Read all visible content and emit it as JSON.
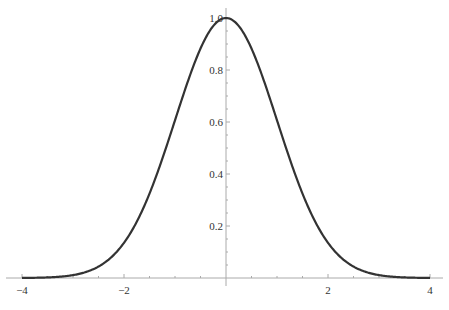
{
  "chart_data": {
    "type": "line",
    "title": "",
    "xlabel": "",
    "ylabel": "",
    "xlim": [
      -4,
      4
    ],
    "ylim": [
      0,
      1.0
    ],
    "grid": false,
    "legend": null,
    "x_ticks": [
      "-4",
      "-2",
      "2",
      "4"
    ],
    "y_ticks": [
      "0.2",
      "0.4",
      "0.6",
      "0.8",
      "1.0"
    ],
    "series": [
      {
        "name": "exp(-x^2/2)",
        "color": "#333333",
        "x": [
          -4,
          -3.5,
          -3,
          -2.5,
          -2,
          -1.5,
          -1,
          -0.5,
          0,
          0.5,
          1,
          1.5,
          2,
          2.5,
          3,
          3.5,
          4
        ],
        "y": [
          0.0003,
          0.0022,
          0.0111,
          0.0439,
          0.1353,
          0.3247,
          0.6065,
          0.8825,
          1.0,
          0.8825,
          0.6065,
          0.3247,
          0.1353,
          0.0439,
          0.0111,
          0.0022,
          0.0003
        ]
      }
    ]
  },
  "axes": {
    "x_labels": [
      {
        "text": "-4",
        "value": -4
      },
      {
        "text": "-2",
        "value": -2
      },
      {
        "text": "2",
        "value": 2
      },
      {
        "text": "4",
        "value": 4
      }
    ],
    "y_labels": [
      {
        "text": "0.2",
        "value": 0.2
      },
      {
        "text": "0.4",
        "value": 0.4
      },
      {
        "text": "0.6",
        "value": 0.6
      },
      {
        "text": "0.8",
        "value": 0.8
      },
      {
        "text": "1.0",
        "value": 1.0
      }
    ]
  }
}
